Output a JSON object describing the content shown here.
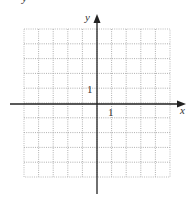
{
  "figure": {
    "type": "coordinate-grid",
    "top_fragment": "y",
    "axes": {
      "x_label": "x",
      "y_label": "y",
      "x_tick_label": "1",
      "y_tick_label": "1"
    },
    "grid": {
      "columns": 10,
      "rows": 10,
      "x_min": -5,
      "x_max": 5,
      "y_min": -5,
      "y_max": 5,
      "line_style": "dotted",
      "line_color": "#9a9a9a"
    },
    "colors": {
      "axis": "#222222",
      "background": "#ffffff"
    }
  }
}
